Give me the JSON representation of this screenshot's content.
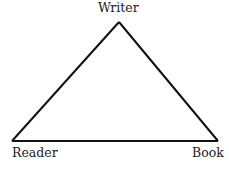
{
  "diagram": {
    "type": "triangle",
    "nodes": [
      {
        "id": "writer",
        "label": "Writer",
        "position": "top"
      },
      {
        "id": "reader",
        "label": "Reader",
        "position": "bottom-left"
      },
      {
        "id": "book",
        "label": "Book",
        "position": "bottom-right"
      }
    ],
    "edges": [
      {
        "from": "writer",
        "to": "reader"
      },
      {
        "from": "writer",
        "to": "book"
      },
      {
        "from": "reader",
        "to": "book"
      }
    ],
    "stroke_color": "#111111"
  }
}
